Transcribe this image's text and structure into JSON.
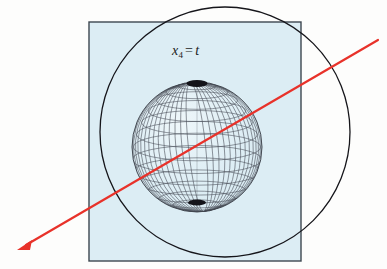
{
  "figure": {
    "name": "spacelike-slice-with-sphere-and-worldline",
    "background_color": "#fdfdfc",
    "width": 387,
    "height": 269
  },
  "slice_square": {
    "name": "spacelike-hypersurface-square",
    "fill_color": "#dcedf4",
    "stroke_color": "#3c4650",
    "stroke_width": 1.4,
    "x": 89,
    "y": 22,
    "width": 212,
    "height": 239
  },
  "big_circle": {
    "name": "horizon-circle",
    "stroke_color": "#15151a",
    "stroke_width": 1.3,
    "fill": "none",
    "cx": 225,
    "cy": 132,
    "r": 125
  },
  "sphere": {
    "name": "wireframe-sphere",
    "cx": 197,
    "cy": 147,
    "r": 65,
    "stroke_color": "#4a4f59",
    "pole_color": "#14141a",
    "meridian_count": 18,
    "parallel_count": 13,
    "tilt_degrees": 16
  },
  "arrow": {
    "name": "null-geodesic-arrow",
    "color": "#e8322a",
    "stroke_width": 2.2,
    "start_x": 378,
    "start_y": 40,
    "end_x": 17,
    "end_y": 250,
    "head_length": 13,
    "head_width": 9
  },
  "labels": {
    "slice_label": {
      "name": "slice-time-label",
      "symbol": "x",
      "subscript": "4",
      "equals": "=",
      "value": "t",
      "x": 172,
      "y": 43
    }
  }
}
